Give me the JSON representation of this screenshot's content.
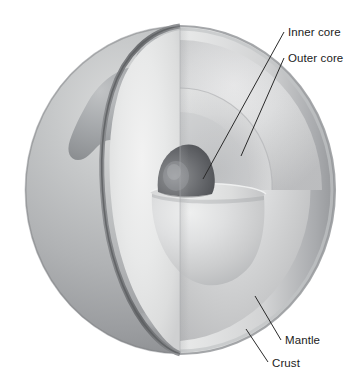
{
  "figure": {
    "background_color": "#ffffff",
    "labels": [
      {
        "id": "inner-core",
        "text": "Inner core",
        "text_x": 288,
        "text_y": 36,
        "line": {
          "x1": 284,
          "y1": 32,
          "x2": 203,
          "y2": 179
        }
      },
      {
        "id": "outer-core",
        "text": "Outer core",
        "text_x": 288,
        "text_y": 62,
        "line": {
          "x1": 284,
          "y1": 58,
          "x2": 241,
          "y2": 156
        }
      },
      {
        "id": "mantle",
        "text": "Mantle",
        "text_x": 285,
        "text_y": 344,
        "line": {
          "x1": 281,
          "y1": 340,
          "x2": 255,
          "y2": 296
        }
      },
      {
        "id": "crust",
        "text": "Crust",
        "text_x": 272,
        "text_y": 367,
        "line": {
          "x1": 268,
          "y1": 362,
          "x2": 246,
          "y2": 329
        }
      }
    ],
    "globe": {
      "center_x": 180,
      "center_y": 190,
      "radius_x": 155,
      "radius_y": 164,
      "cut_plane_x": 180,
      "surface_color": "#b4b6b8",
      "ocean_color": "#a9abad",
      "land_color": "#8e9194",
      "crust_color": "#6f7174",
      "mantle_color": "#d9dadb",
      "mantle_cut_color": "#e6e7e8",
      "outer_core_color": "#cacbcc",
      "inner_core_color": "#5f6164"
    },
    "layers": [
      {
        "name": "Crust",
        "order": 1
      },
      {
        "name": "Mantle",
        "order": 2
      },
      {
        "name": "Outer core",
        "order": 3
      },
      {
        "name": "Inner core",
        "order": 4
      }
    ]
  }
}
